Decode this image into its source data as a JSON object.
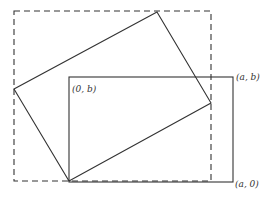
{
  "diagram": {
    "labels": {
      "top_left_inner": "(0, b)",
      "top_right": "(a, b)",
      "bottom_right": "(a, 0)"
    },
    "colors": {
      "stroke": "#333333",
      "background": "#ffffff"
    },
    "shapes": {
      "solid_rectangle": {
        "x1": 69,
        "y1": 77,
        "x2": 233,
        "y2": 182
      },
      "dashed_rectangle": {
        "x1": 14,
        "y1": 11,
        "x2": 211,
        "y2": 181
      },
      "rotated_rectangle": [
        [
          157,
          12
        ],
        [
          211,
          103
        ],
        [
          69,
          181
        ],
        [
          14,
          89
        ]
      ]
    }
  }
}
